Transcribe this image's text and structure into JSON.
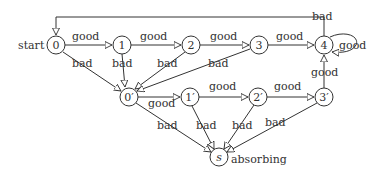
{
  "diagram": {
    "type": "state-transition",
    "nodes": [
      {
        "id": "n0",
        "label": "0",
        "x": 56,
        "y": 45
      },
      {
        "id": "n1",
        "label": "1",
        "x": 122,
        "y": 45
      },
      {
        "id": "n2",
        "label": "2",
        "x": 191,
        "y": 45
      },
      {
        "id": "n3",
        "label": "3",
        "x": 259,
        "y": 45
      },
      {
        "id": "n4",
        "label": "4",
        "x": 324,
        "y": 45
      },
      {
        "id": "n0p",
        "label": "0′",
        "x": 129,
        "y": 97
      },
      {
        "id": "n1p",
        "label": "1′",
        "x": 190,
        "y": 97
      },
      {
        "id": "n2p",
        "label": "2′",
        "x": 258,
        "y": 97
      },
      {
        "id": "n3p",
        "label": "3′",
        "x": 324,
        "y": 97
      },
      {
        "id": "ns",
        "label": "s",
        "x": 219,
        "y": 157
      }
    ],
    "start_label": "start",
    "absorbing_label": "absorbing",
    "edges": [
      {
        "from": "n0",
        "to": "n1",
        "label": "good"
      },
      {
        "from": "n1",
        "to": "n2",
        "label": "good"
      },
      {
        "from": "n2",
        "to": "n3",
        "label": "good"
      },
      {
        "from": "n3",
        "to": "n4",
        "label": "good"
      },
      {
        "from": "n4",
        "to": "n4",
        "label": "good"
      },
      {
        "from": "n4",
        "to": "n0",
        "label": "bad"
      },
      {
        "from": "n0",
        "to": "n0p",
        "label": "bad"
      },
      {
        "from": "n1",
        "to": "n0p",
        "label": "bad"
      },
      {
        "from": "n2",
        "to": "n0p",
        "label": "bad"
      },
      {
        "from": "n3",
        "to": "n0p",
        "label": "bad"
      },
      {
        "from": "n0p",
        "to": "n1p",
        "label": "good"
      },
      {
        "from": "n1p",
        "to": "n2p",
        "label": "good"
      },
      {
        "from": "n2p",
        "to": "n3p",
        "label": "good"
      },
      {
        "from": "n3p",
        "to": "n4",
        "label": "good"
      },
      {
        "from": "n0p",
        "to": "ns",
        "label": "bad"
      },
      {
        "from": "n1p",
        "to": "ns",
        "label": "bad"
      },
      {
        "from": "n2p",
        "to": "ns",
        "label": "bad"
      },
      {
        "from": "n3p",
        "to": "ns",
        "label": "bad"
      }
    ]
  }
}
